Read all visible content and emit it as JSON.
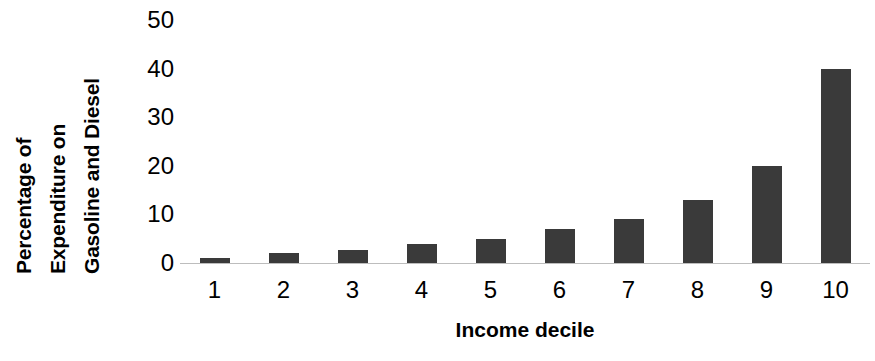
{
  "chart_data": {
    "type": "bar",
    "title": "",
    "categories": [
      "1",
      "2",
      "3",
      "4",
      "5",
      "6",
      "7",
      "8",
      "9",
      "10"
    ],
    "values": [
      1,
      2,
      2.6,
      4,
      5,
      7,
      9,
      13,
      20,
      40
    ],
    "xlabel": "Income decile",
    "ylabel": "Percentage of Expenditure on Gasoline and Diesel",
    "ylabel_lines": [
      "Percentage of",
      "Expenditure on",
      "Gasoline  and Diesel"
    ],
    "ylim": [
      0,
      50
    ],
    "xlim": [
      0,
      11
    ],
    "yticks": [
      0,
      10,
      20,
      30,
      40,
      50
    ],
    "ytick_labels": [
      "0",
      "10",
      "20",
      "30",
      "40",
      "50"
    ],
    "xtick_labels": [
      "1",
      "2",
      "3",
      "4",
      "5",
      "6",
      "7",
      "8",
      "9",
      "10"
    ],
    "grid": false,
    "legend": null,
    "legend_position": "none",
    "bar_color": "#3a3a3a",
    "axis_color": "#bdbdbd",
    "text_color": "#000000",
    "background_color": "#ffffff"
  }
}
